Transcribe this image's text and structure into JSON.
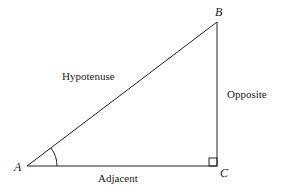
{
  "diagram": {
    "vertices": {
      "A": "A",
      "B": "B",
      "C": "C"
    },
    "sides": {
      "hypotenuse": "Hypotenuse",
      "opposite": "Opposite",
      "adjacent": "Adjacent"
    },
    "colors": {
      "stroke": "#222222",
      "background": "#ffffff"
    }
  }
}
